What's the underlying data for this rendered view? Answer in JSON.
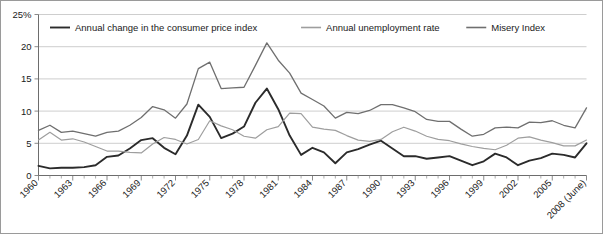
{
  "chart_data": {
    "type": "line",
    "title": "",
    "xlabel": "",
    "ylabel": "",
    "ylim": [
      0,
      25
    ],
    "xlim": [
      1960,
      2008
    ],
    "grid": true,
    "legend_position": "top",
    "y_ticks": [
      "25%",
      "20",
      "15",
      "10",
      "5",
      "0"
    ],
    "y_tick_values": [
      25,
      20,
      15,
      10,
      5,
      0
    ],
    "x_tick_labels": [
      "1960",
      "1963",
      "1966",
      "1969",
      "1972",
      "1975",
      "1978",
      "1981",
      "1984",
      "1987",
      "1990",
      "1993",
      "1996",
      "1999",
      "2002",
      "2005",
      "2008 (June)"
    ],
    "x_tick_values": [
      1960,
      1963,
      1966,
      1969,
      1972,
      1975,
      1978,
      1981,
      1984,
      1987,
      1990,
      1993,
      1996,
      1999,
      2002,
      2005,
      2008
    ],
    "x": [
      1960,
      1961,
      1962,
      1963,
      1964,
      1965,
      1966,
      1967,
      1968,
      1969,
      1970,
      1971,
      1972,
      1973,
      1974,
      1975,
      1976,
      1977,
      1978,
      1979,
      1980,
      1981,
      1982,
      1983,
      1984,
      1985,
      1986,
      1987,
      1988,
      1989,
      1990,
      1991,
      1992,
      1993,
      1994,
      1995,
      1996,
      1997,
      1998,
      1999,
      2000,
      2001,
      2002,
      2003,
      2004,
      2005,
      2006,
      2007,
      2008
    ],
    "series": [
      {
        "name": "Annual change in the consumer price index",
        "color": "#2b2b2b",
        "width": 1.9,
        "values": [
          1.5,
          1.1,
          1.2,
          1.2,
          1.3,
          1.6,
          2.9,
          3.1,
          4.2,
          5.5,
          5.8,
          4.3,
          3.3,
          6.2,
          11.0,
          9.1,
          5.8,
          6.5,
          7.6,
          11.3,
          13.5,
          10.3,
          6.2,
          3.2,
          4.3,
          3.6,
          1.9,
          3.6,
          4.1,
          4.8,
          5.4,
          4.2,
          3.0,
          3.0,
          2.6,
          2.8,
          3.0,
          2.3,
          1.6,
          2.2,
          3.4,
          2.8,
          1.6,
          2.3,
          2.7,
          3.4,
          3.2,
          2.8,
          5.0
        ]
      },
      {
        "name": "Annual unemployment rate",
        "color": "#9e9e9e",
        "width": 1.2,
        "values": [
          5.5,
          6.7,
          5.5,
          5.7,
          5.2,
          4.5,
          3.8,
          3.8,
          3.6,
          3.5,
          4.9,
          5.9,
          5.6,
          4.9,
          5.6,
          8.5,
          7.7,
          7.1,
          6.1,
          5.8,
          7.1,
          7.6,
          9.7,
          9.6,
          7.5,
          7.2,
          7.0,
          6.2,
          5.5,
          5.3,
          5.6,
          6.8,
          7.5,
          6.9,
          6.1,
          5.6,
          5.4,
          4.9,
          4.5,
          4.2,
          4.0,
          4.7,
          5.8,
          6.0,
          5.5,
          5.1,
          4.6,
          4.6,
          5.5
        ]
      },
      {
        "name": "Misery Index",
        "color": "#6f6f6f",
        "width": 1.3,
        "values": [
          7.0,
          7.8,
          6.7,
          6.9,
          6.5,
          6.1,
          6.7,
          6.9,
          7.8,
          9.0,
          10.7,
          10.2,
          8.9,
          11.1,
          16.6,
          17.6,
          13.5,
          13.6,
          13.7,
          17.1,
          20.6,
          17.9,
          15.9,
          12.8,
          11.8,
          10.8,
          8.9,
          9.8,
          9.6,
          10.1,
          11.0,
          11.0,
          10.5,
          9.9,
          8.7,
          8.4,
          8.4,
          7.2,
          6.1,
          6.4,
          7.4,
          7.5,
          7.4,
          8.3,
          8.2,
          8.5,
          7.8,
          7.4,
          10.5
        ]
      }
    ]
  },
  "legend": {
    "items": [
      {
        "label": "Annual change in the consumer price index"
      },
      {
        "label": "Annual unemployment rate"
      },
      {
        "label": "Misery Index"
      }
    ]
  }
}
